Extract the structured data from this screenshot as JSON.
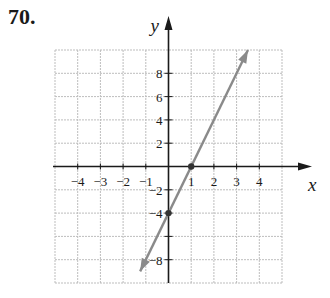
{
  "problem_number": "70.",
  "axes": {
    "x_label": "x",
    "y_label": "y",
    "x_ticks": [
      "−4",
      "−3",
      "−2",
      "−1",
      "1",
      "2",
      "3",
      "4"
    ],
    "y_ticks_pos": [
      "2",
      "4",
      "6",
      "8"
    ],
    "y_ticks_neg": [
      "−2",
      "−4",
      "−8"
    ]
  },
  "colors": {
    "grid": "#bdbdbd",
    "axis": "#1a1a1a",
    "line": "#8a8a8a",
    "text": "#1a1a1a"
  },
  "chart_data": {
    "type": "line",
    "title": "",
    "xlabel": "x",
    "ylabel": "y",
    "xlim": [
      -5,
      5
    ],
    "ylim": [
      -10,
      10
    ],
    "grid": true,
    "x_tick_values": [
      -4,
      -3,
      -2,
      -1,
      1,
      2,
      3,
      4
    ],
    "y_tick_values": [
      -8,
      -4,
      -2,
      2,
      4,
      6,
      8
    ],
    "series": [
      {
        "name": "y = 4x - 4",
        "x": [
          -1.25,
          3.5
        ],
        "y": [
          -9,
          10
        ],
        "arrows": "both"
      }
    ],
    "points": [
      {
        "x": 1,
        "y": 0
      },
      {
        "x": 0,
        "y": -4
      }
    ]
  }
}
